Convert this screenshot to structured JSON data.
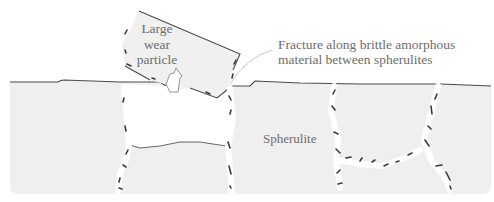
{
  "diagram": {
    "labels": {
      "particle": [
        "Large",
        "wear",
        "particle"
      ],
      "fracture": [
        "Fracture along brittle amorphous",
        "material between spherulites"
      ],
      "spherulite": "Spherulite"
    },
    "colors": {
      "substrate_fill": "#efefef",
      "outline": "#4a4a4a",
      "label_text": "#6d6d6d",
      "leader_line": "#c8c8c8",
      "crack_marks": "#3a3a3a"
    }
  }
}
